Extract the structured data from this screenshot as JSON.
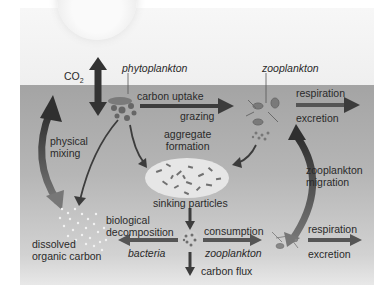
{
  "labels": {
    "co2": "CO",
    "co2_sub": "2",
    "phytoplankton": "phytoplankton",
    "zooplankton_top": "zooplankton",
    "carbon_uptake": "carbon uptake",
    "grazing": "grazing",
    "respiration_top": "respiration",
    "excretion_top": "excretion",
    "physical_mixing_1": "physical",
    "physical_mixing_2": "mixing",
    "aggregate_formation_1": "aggregate",
    "aggregate_formation_2": "formation",
    "zooplankton_migration_1": "zooplankton",
    "zooplankton_migration_2": "migration",
    "sinking_particles": "sinking particles",
    "biological_decomposition_1": "biological",
    "biological_decomposition_2": "decomposition",
    "bacteria": "bacteria",
    "consumption": "consumption",
    "zooplankton_bottom": "zooplankton",
    "respiration_bottom": "respiration",
    "excretion_bottom": "excretion",
    "dissolved_organic_carbon_1": "dissolved",
    "dissolved_organic_carbon_2": "organic carbon",
    "carbon_flux": "carbon flux"
  },
  "colors": {
    "arrow_dark": "#3c3c3c",
    "arrow_mid": "#555555",
    "water_top": "#a4a4a4",
    "water_bottom": "#e8e8e8",
    "sky": "#f3f3f3"
  },
  "icons": [
    "sun-icon",
    "phytoplankton-cluster-icon",
    "zooplankton-cluster-icon",
    "aggregate-particles-icon",
    "dissolved-carbon-dots-icon",
    "deep-particle-icon",
    "deep-zooplankton-icon"
  ]
}
